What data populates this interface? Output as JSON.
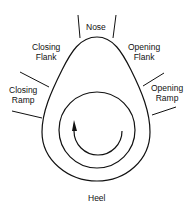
{
  "diagram": {
    "type": "cam lobe profile",
    "labels": {
      "nose": "Nose",
      "closing_flank": [
        "Closing",
        "Flank"
      ],
      "opening_flank": [
        "Opening",
        "Flank"
      ],
      "closing_ramp": [
        "Closing",
        "Ramp"
      ],
      "opening_ramp": [
        "Opening",
        "Ramp"
      ],
      "heel": "Heel"
    },
    "rotation_direction": "counter-clockwise arrow",
    "colors": {
      "stroke": "#111111",
      "background": "#ffffff"
    }
  }
}
